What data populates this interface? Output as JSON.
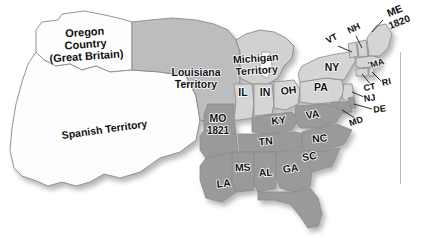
{
  "map": {
    "title": "The Missouri Compromise 1820",
    "background_color": "#ffffff",
    "colors": {
      "slave_state": "#9a9a9a",
      "free_state": "#d5d5d5",
      "territory_louisiana": "#bdbdbd",
      "territory_michigan": "#d0d0d0",
      "foreign_white": "#fdfdfd",
      "outline": "#8a8a8a",
      "label_text": "#101010",
      "shadow": "#c8c8c8"
    },
    "territories": [
      {
        "id": "oregon-country",
        "lines": [
          "Oregon",
          "Country",
          "(Great Britain)"
        ],
        "x": 85,
        "y": 36,
        "fill": "foreign_white"
      },
      {
        "id": "spanish-territory",
        "lines": [
          "Spanish Territory"
        ],
        "x": 105,
        "y": 133,
        "fill": "foreign_white",
        "rotation": -8
      },
      {
        "id": "louisiana-territory",
        "lines": [
          "Louisiana",
          "Territory"
        ],
        "x": 196,
        "y": 76,
        "fill": "territory_louisiana"
      },
      {
        "id": "michigan-territory",
        "lines": [
          "Michigan",
          "Territory"
        ],
        "x": 256,
        "y": 62,
        "fill": "territory_michigan"
      }
    ],
    "states": [
      {
        "code": "MO",
        "year": "1821",
        "x": 218,
        "y": 122,
        "type": "slave"
      },
      {
        "code": "ME",
        "year": "1820",
        "x": 396,
        "y": 14,
        "type": "free"
      },
      {
        "code": "IL",
        "x": 243,
        "y": 96,
        "type": "free"
      },
      {
        "code": "IN",
        "x": 265,
        "y": 96,
        "type": "free"
      },
      {
        "code": "OH",
        "x": 289,
        "y": 94,
        "type": "free"
      },
      {
        "code": "PA",
        "x": 321,
        "y": 91,
        "type": "free"
      },
      {
        "code": "NY",
        "x": 332,
        "y": 71,
        "type": "free"
      },
      {
        "code": "VT",
        "x": 333,
        "y": 41,
        "type": "free"
      },
      {
        "code": "NH",
        "x": 355,
        "y": 31,
        "type": "free"
      },
      {
        "code": "MA",
        "x": 375,
        "y": 66,
        "type": "free"
      },
      {
        "code": "CT",
        "x": 368,
        "y": 89,
        "type": "free"
      },
      {
        "code": "RI",
        "x": 385,
        "y": 86,
        "type": "free"
      },
      {
        "code": "NJ",
        "x": 369,
        "y": 100,
        "type": "free"
      },
      {
        "code": "DE",
        "x": 379,
        "y": 112,
        "type": "slave"
      },
      {
        "code": "MD",
        "x": 355,
        "y": 124,
        "type": "slave"
      },
      {
        "code": "VA",
        "x": 313,
        "y": 118,
        "type": "slave"
      },
      {
        "code": "KY",
        "x": 279,
        "y": 124,
        "type": "slave"
      },
      {
        "code": "TN",
        "x": 266,
        "y": 145,
        "type": "slave"
      },
      {
        "code": "NC",
        "x": 320,
        "y": 142,
        "type": "slave"
      },
      {
        "code": "SC",
        "x": 310,
        "y": 160,
        "type": "slave"
      },
      {
        "code": "GA",
        "x": 291,
        "y": 172,
        "type": "slave"
      },
      {
        "code": "AL",
        "x": 266,
        "y": 175,
        "type": "slave"
      },
      {
        "code": "MS",
        "x": 243,
        "y": 170,
        "type": "slave"
      },
      {
        "code": "LA",
        "x": 224,
        "y": 186,
        "type": "slave"
      }
    ],
    "legend_panel": {
      "visible": true,
      "cropped": true,
      "text": ""
    }
  }
}
